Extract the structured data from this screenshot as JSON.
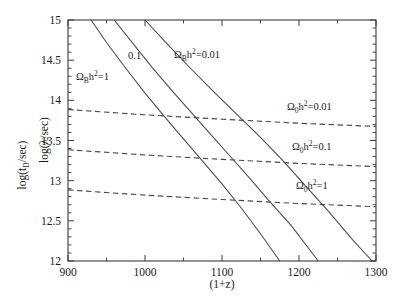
{
  "figure": {
    "background": "#ffffff",
    "ink_color": "#3a3a3a",
    "curve_color": "#4a4a4a"
  },
  "chart_data": {
    "type": "line",
    "title": "",
    "xlabel": "(1+z)",
    "ylabel_primary": "log(λ/sec)",
    "ylabel_secondary": "log(t_D/sec)",
    "xlim": [
      900,
      1300
    ],
    "ylim": [
      12,
      15
    ],
    "xticks": [
      900,
      1000,
      1100,
      1200,
      1300
    ],
    "xticklabels": [
      "900",
      "1000",
      "1100",
      "1200",
      "1300"
    ],
    "xminor_step": 50,
    "yticks": [
      12,
      12.5,
      13,
      13.5,
      14,
      14.5,
      15
    ],
    "yticklabels": [
      "12",
      "12.5",
      "13",
      "13.5",
      "14",
      "14.5",
      "15"
    ],
    "yminor_step": 0.1,
    "grid": false,
    "legend": "inline-annotations",
    "series": [
      {
        "name": "Ω_B h² = 1",
        "style": "solid",
        "label_text": "Ω",
        "label_sub": "B",
        "label_base": "h",
        "label_sup": "2",
        "label_value": "=1",
        "x": [
          930,
          950,
          975,
          1000,
          1025,
          1050,
          1075,
          1100,
          1125,
          1150,
          1175
        ],
        "y": [
          15.0,
          14.72,
          14.4,
          14.09,
          13.8,
          13.52,
          13.24,
          12.96,
          12.66,
          12.34,
          12.0
        ]
      },
      {
        "name": "Ω_B h² = 0.1",
        "style": "solid",
        "label_value": "0.1",
        "x": [
          960,
          985,
          1010,
          1035,
          1060,
          1085,
          1110,
          1135,
          1160,
          1190,
          1225
        ],
        "y": [
          15.0,
          14.7,
          14.4,
          14.12,
          13.85,
          13.58,
          13.31,
          13.04,
          12.76,
          12.44,
          12.0
        ]
      },
      {
        "name": "Ω_B h² = 0.01",
        "style": "solid",
        "label_text": "Ω",
        "label_sub": "B",
        "label_base": "h",
        "label_sup": "2",
        "label_value": "=0.01",
        "x": [
          1000,
          1030,
          1060,
          1090,
          1120,
          1150,
          1180,
          1210,
          1240,
          1270,
          1295
        ],
        "y": [
          15.0,
          14.69,
          14.39,
          14.1,
          13.82,
          13.54,
          13.24,
          12.92,
          12.6,
          12.26,
          12.0
        ]
      },
      {
        "name": "Ω_0 h² = 0.01",
        "style": "dashed",
        "label_text": "Ω",
        "label_sub": "0",
        "label_base": "h",
        "label_sup": "2",
        "label_value": "=0.01",
        "x": [
          900,
          1000,
          1100,
          1200,
          1300
        ],
        "y": [
          13.885,
          13.82,
          13.765,
          13.715,
          13.675
        ]
      },
      {
        "name": "Ω_0 h² = 0.1",
        "style": "dashed",
        "label_text": "Ω",
        "label_sub": "0",
        "label_base": "h",
        "label_sup": "2",
        "label_value": "=0.1",
        "x": [
          900,
          1000,
          1100,
          1200,
          1300
        ],
        "y": [
          13.385,
          13.32,
          13.265,
          13.215,
          13.175
        ]
      },
      {
        "name": "Ω_0 h² = 1",
        "style": "dashed",
        "label_text": "Ω",
        "label_sub": "0",
        "label_base": "h",
        "label_sup": "2",
        "label_value": "=1",
        "x": [
          900,
          1000,
          1100,
          1200,
          1300
        ],
        "y": [
          12.885,
          12.82,
          12.765,
          12.715,
          12.675
        ]
      }
    ],
    "annotations": [
      {
        "id": "omega-b-1",
        "text": "Ω",
        "sub": "B",
        "base": "h",
        "sup": "2",
        "value": "=1",
        "x_px": 76,
        "y_px": 80
      },
      {
        "id": "omega-b-0p1",
        "text": "",
        "sub": "",
        "base": "",
        "sup": "",
        "value": "0.1",
        "x_px": 128,
        "y_px": 59
      },
      {
        "id": "omega-b-0p01",
        "text": "Ω",
        "sub": "B",
        "base": "h",
        "sup": "2",
        "value": "=0.01",
        "x_px": 174,
        "y_px": 58
      },
      {
        "id": "omega-0-0p01",
        "text": "Ω",
        "sub": "0",
        "base": "h",
        "sup": "2",
        "value": "=0.01",
        "x_px": 287,
        "y_px": 110
      },
      {
        "id": "omega-0-0p1",
        "text": "Ω",
        "sub": "0",
        "base": "h",
        "sup": "2",
        "value": "=0.1",
        "x_px": 292,
        "y_px": 150
      },
      {
        "id": "omega-0-1",
        "text": "Ω",
        "sub": "0",
        "base": "h",
        "sup": "2",
        "value": "=1",
        "x_px": 296,
        "y_px": 189
      }
    ]
  },
  "axes": {
    "y_title_lambda": {
      "prefix": "log(",
      "symbol": "λ",
      "suffix": "/sec)"
    },
    "y_title_td": {
      "prefix": "log(t",
      "sub": "D",
      "suffix": "/sec)"
    },
    "x_title": "(1+z)"
  }
}
